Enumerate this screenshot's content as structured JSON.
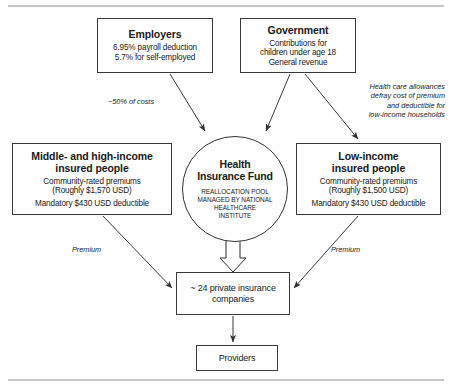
{
  "diagram": {
    "rules": {
      "top": "horizontal-rule",
      "bottom": "horizontal-rule"
    },
    "nodes": {
      "employers": {
        "title": "Employers",
        "lines": [
          "6.95% payroll deduction",
          "5.7% for self-employed"
        ]
      },
      "government": {
        "title": "Government",
        "lines": [
          "Contributions for",
          "children under age 18",
          "General revenue"
        ]
      },
      "fund": {
        "title_line1": "Health",
        "title_line2": "Insurance Fund",
        "sub_lines": [
          "REALLOCATION POOL",
          "MANAGED BY NATIONAL",
          "HEALTHCARE",
          "INSTITUTE"
        ]
      },
      "middle_high": {
        "title_line1": "Middle- and high-income",
        "title_line2": "insured people",
        "group1": [
          "Community-rated premiums",
          "(Roughly $1,570 USD)"
        ],
        "group2": [
          "Mandatory $430 USD deductible"
        ]
      },
      "low_income": {
        "title_line1": "Low-income",
        "title_line2": "insured people",
        "group1": [
          "Community-rated premiums",
          "(Roughly $1,500 USD)"
        ],
        "group2": [
          "Mandatory $430 USD deductible"
        ]
      },
      "insurers": {
        "line1": "~ 24 private insurance",
        "line2": "companies"
      },
      "providers": {
        "label": "Providers"
      }
    },
    "annotations": {
      "costs": "~50% of costs",
      "allowance_line1": "Health care allowances",
      "allowance_line2": "defray cost of premium",
      "allowance_line3": "and deductible for",
      "allowance_line4": "low-income households",
      "premium_left": "Premium",
      "premium_right": "Premium"
    },
    "edges": [
      {
        "from": "employers",
        "to": "fund",
        "label": "~50% of costs",
        "style": "thin-arrow"
      },
      {
        "from": "government",
        "to": "fund",
        "label": "",
        "style": "thin-arrow"
      },
      {
        "from": "government",
        "to": "low_income",
        "label": "Health care allowances defray cost of premium and deductible for low-income households",
        "style": "thin-arrow"
      },
      {
        "from": "fund",
        "to": "insurers",
        "label": "",
        "style": "hollow-block-arrow"
      },
      {
        "from": "middle_high",
        "to": "insurers",
        "label": "Premium",
        "style": "thin-arrow"
      },
      {
        "from": "low_income",
        "to": "insurers",
        "label": "Premium",
        "style": "thin-arrow"
      },
      {
        "from": "insurers",
        "to": "providers",
        "label": "",
        "style": "thin-arrow"
      }
    ],
    "colors": {
      "stroke": "#3a3a3a",
      "text": "#1a1a1a",
      "background": "#fefefe",
      "rule": "#8d8d8d"
    }
  }
}
